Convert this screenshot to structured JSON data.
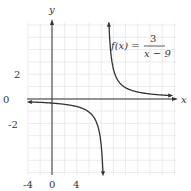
{
  "chart_data": {
    "type": "line",
    "title": "",
    "function_label": {
      "lhs": "f(x) =",
      "numerator": "3",
      "denominator": "x − 9"
    },
    "xlabel": "x",
    "ylabel": "y",
    "x_ticks": [
      "-4",
      "0",
      "4"
    ],
    "y_ticks": [
      "2",
      "0",
      "-2"
    ],
    "xlim": [
      -4,
      20
    ],
    "ylim": [
      -6,
      6
    ],
    "grid": true,
    "vertical_asymptote": 9,
    "horizontal_asymptote": 0,
    "series": [
      {
        "name": "left branch",
        "x": [
          -4,
          -2,
          0,
          2,
          4,
          6,
          7,
          8,
          8.5
        ],
        "y": [
          -0.23,
          -0.27,
          -0.33,
          -0.43,
          -0.6,
          -1.0,
          -1.5,
          -3.0,
          -6.0
        ]
      },
      {
        "name": "right branch",
        "x": [
          9.5,
          10,
          11,
          12,
          14,
          16,
          18,
          20
        ],
        "y": [
          6.0,
          3.0,
          1.5,
          1.0,
          0.6,
          0.43,
          0.33,
          0.27
        ]
      }
    ]
  },
  "colors": {
    "axis": "#333333",
    "curve": "#333333",
    "grid": "#e6e6e6"
  }
}
